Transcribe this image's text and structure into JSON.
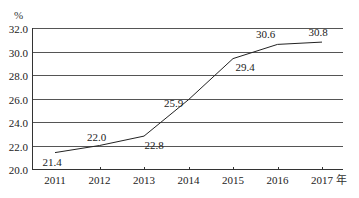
{
  "chart_data": {
    "type": "line",
    "title": "",
    "xlabel": "年",
    "ylabel": "%",
    "categories": [
      "2011",
      "2012",
      "2013",
      "2014",
      "2015",
      "2016",
      "2017"
    ],
    "series": [
      {
        "name": "",
        "values": [
          21.4,
          22.0,
          22.8,
          25.9,
          29.4,
          30.6,
          30.8
        ]
      }
    ],
    "data_labels": [
      "21.4",
      "22.0",
      "22.8",
      "25.9",
      "29.4",
      "30.6",
      "30.8"
    ],
    "ylim": [
      20.0,
      32.0
    ],
    "yticks": [
      "20.0",
      "22.0",
      "24.0",
      "26.0",
      "28.0",
      "30.0",
      "32.0"
    ],
    "grid": true,
    "legend": "none",
    "colors": {
      "line": "#222222",
      "grid": "#555555"
    }
  }
}
